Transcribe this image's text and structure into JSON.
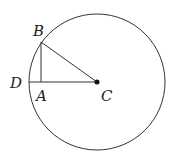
{
  "diagram": {
    "circle": {
      "cx": 97,
      "cy": 82,
      "r": 68
    },
    "points": {
      "B": {
        "x": 41,
        "y": 42,
        "label": "B"
      },
      "A": {
        "x": 41,
        "y": 82,
        "label": "A"
      },
      "C": {
        "x": 97,
        "y": 82,
        "label": "C"
      },
      "D": {
        "x": 29,
        "y": 82,
        "label": "D"
      }
    },
    "labels": {
      "B": "B",
      "A": "A",
      "C": "C",
      "D": "D"
    }
  }
}
